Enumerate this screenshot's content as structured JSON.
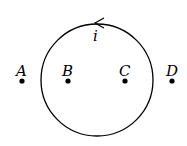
{
  "diagram": {
    "current_label": "i",
    "points": [
      {
        "label": "A",
        "x": 21,
        "y": 80
      },
      {
        "label": "B",
        "x": 68,
        "y": 80
      },
      {
        "label": "C",
        "x": 125,
        "y": 80
      },
      {
        "label": "D",
        "x": 171,
        "y": 80
      }
    ],
    "loop": {
      "cx": 97,
      "cy": 80,
      "r": 56,
      "direction": "counterclockwise"
    }
  }
}
